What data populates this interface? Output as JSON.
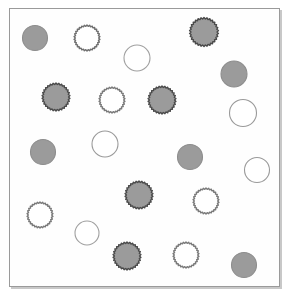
{
  "figure": {
    "width": 289,
    "height": 296,
    "background_color": "#ffffff"
  },
  "frame": {
    "name": "plot-frame",
    "x": 9,
    "y": 8,
    "width": 271,
    "height": 279,
    "border_color": "#9a9a9a",
    "border_width": 1,
    "fill_color": "#fefefe",
    "shadow_color": "#c8c8c8"
  },
  "legend_keys": {
    "filled_smooth": "solid gray circle with smooth outline",
    "filled_spiky": "solid gray circle with spiky crenated outline",
    "open_smooth": "unfilled white circle with smooth outline",
    "open_spiky": "unfilled white circle with spiky crenated outline"
  },
  "palette": {
    "fill_gray": "#9b9b9b",
    "fill_gray_light": "#a8a8a8",
    "outline_dark": "#555555",
    "outline_mid": "#777777",
    "outline_light": "#8d8d8d",
    "open_fill": "#ffffff"
  },
  "counts": {
    "total": 24,
    "filled": 11,
    "open": 13,
    "spiky": 13,
    "smooth": 11
  },
  "chart_data": {
    "type": "scatter",
    "xlabel": "",
    "ylabel": "",
    "xlim": [
      9,
      280
    ],
    "ylim": [
      8,
      287
    ],
    "grid": false,
    "legend": "none",
    "categories": [
      "filled_smooth",
      "filled_spiky",
      "open_smooth",
      "open_spiky"
    ],
    "values": [
      5,
      6,
      7,
      6
    ],
    "points": [
      {
        "id": 1,
        "cx": 35,
        "cy": 38,
        "r": 12.5,
        "fill": "#9b9b9b",
        "stroke": "#8d8d8d",
        "edge": "smooth"
      },
      {
        "id": 2,
        "cx": 87,
        "cy": 38,
        "r": 13.0,
        "fill": "#ffffff",
        "stroke": "#6f6f6f",
        "edge": "spiky"
      },
      {
        "id": 3,
        "cx": 137,
        "cy": 58,
        "r": 13.0,
        "fill": "#ffffff",
        "stroke": "#a0a0a0",
        "edge": "smooth"
      },
      {
        "id": 4,
        "cx": 204,
        "cy": 32,
        "r": 14.5,
        "fill": "#9b9b9b",
        "stroke": "#4a4a4a",
        "edge": "spiky"
      },
      {
        "id": 5,
        "cx": 234,
        "cy": 74,
        "r": 13.0,
        "fill": "#9b9b9b",
        "stroke": "#8d8d8d",
        "edge": "smooth"
      },
      {
        "id": 6,
        "cx": 56,
        "cy": 97,
        "r": 14.0,
        "fill": "#9b9b9b",
        "stroke": "#4a4a4a",
        "edge": "spiky"
      },
      {
        "id": 7,
        "cx": 112,
        "cy": 100,
        "r": 13.0,
        "fill": "#ffffff",
        "stroke": "#7a7a7a",
        "edge": "spiky"
      },
      {
        "id": 8,
        "cx": 162,
        "cy": 100,
        "r": 14.0,
        "fill": "#9b9b9b",
        "stroke": "#4a4a4a",
        "edge": "spiky"
      },
      {
        "id": 9,
        "cx": 243,
        "cy": 113,
        "r": 13.5,
        "fill": "#ffffff",
        "stroke": "#9a9a9a",
        "edge": "smooth"
      },
      {
        "id": 10,
        "cx": 105,
        "cy": 144,
        "r": 13.0,
        "fill": "#ffffff",
        "stroke": "#9a9a9a",
        "edge": "smooth"
      },
      {
        "id": 11,
        "cx": 43,
        "cy": 152,
        "r": 12.5,
        "fill": "#9b9b9b",
        "stroke": "#8d8d8d",
        "edge": "smooth"
      },
      {
        "id": 12,
        "cx": 190,
        "cy": 157,
        "r": 12.5,
        "fill": "#9b9b9b",
        "stroke": "#8d8d8d",
        "edge": "smooth"
      },
      {
        "id": 13,
        "cx": 257,
        "cy": 170,
        "r": 12.5,
        "fill": "#ffffff",
        "stroke": "#9a9a9a",
        "edge": "smooth"
      },
      {
        "id": 14,
        "cx": 139,
        "cy": 195,
        "r": 14.0,
        "fill": "#9b9b9b",
        "stroke": "#4a4a4a",
        "edge": "spiky"
      },
      {
        "id": 15,
        "cx": 206,
        "cy": 201,
        "r": 13.0,
        "fill": "#ffffff",
        "stroke": "#7a7a7a",
        "edge": "spiky"
      },
      {
        "id": 16,
        "cx": 40,
        "cy": 215,
        "r": 13.0,
        "fill": "#ffffff",
        "stroke": "#7a7a7a",
        "edge": "spiky"
      },
      {
        "id": 17,
        "cx": 87,
        "cy": 233,
        "r": 12.0,
        "fill": "#ffffff",
        "stroke": "#a0a0a0",
        "edge": "smooth"
      },
      {
        "id": 18,
        "cx": 127,
        "cy": 256,
        "r": 14.0,
        "fill": "#9b9b9b",
        "stroke": "#4a4a4a",
        "edge": "spiky"
      },
      {
        "id": 19,
        "cx": 186,
        "cy": 255,
        "r": 13.0,
        "fill": "#ffffff",
        "stroke": "#7a7a7a",
        "edge": "spiky"
      },
      {
        "id": 20,
        "cx": 244,
        "cy": 265,
        "r": 12.5,
        "fill": "#9b9b9b",
        "stroke": "#8d8d8d",
        "edge": "smooth"
      }
    ]
  }
}
